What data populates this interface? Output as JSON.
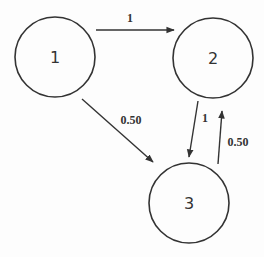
{
  "diagram": {
    "type": "directed-graph",
    "nodes": [
      {
        "id": "1",
        "label": "1",
        "cx": 55,
        "cy": 57,
        "r": 40
      },
      {
        "id": "2",
        "label": "2",
        "cx": 213,
        "cy": 58,
        "r": 40
      },
      {
        "id": "3",
        "label": "3",
        "cx": 189,
        "cy": 203,
        "r": 40
      }
    ],
    "edges": [
      {
        "from": "1",
        "to": "2",
        "label": "1"
      },
      {
        "from": "1",
        "to": "3",
        "label": "0.50"
      },
      {
        "from": "2",
        "to": "3",
        "label": "1"
      },
      {
        "from": "3",
        "to": "2",
        "label": "0.50"
      }
    ]
  },
  "colors": {
    "stroke": "#333333",
    "background": "#fdfdfd"
  }
}
